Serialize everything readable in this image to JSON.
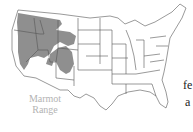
{
  "map": {
    "title": "Contiguous United States",
    "highlight_region": "marmot-range",
    "colors": {
      "range_fill": "#8f8f8f",
      "state_stroke": "#555555",
      "background": "#ffffff",
      "caption": "#b3b3b3"
    }
  },
  "caption": {
    "line1": "Marmot",
    "line2": "Range"
  },
  "side_text": {
    "line1": "fe",
    "line2": "a"
  }
}
